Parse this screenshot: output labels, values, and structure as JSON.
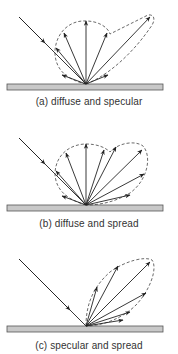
{
  "panels": [
    {
      "id": "a",
      "caption": "(a) diffuse and specular",
      "type": "diffuse-and-specular"
    },
    {
      "id": "b",
      "caption": "(b) diffuse and spread",
      "type": "diffuse-and-spread"
    },
    {
      "id": "c",
      "caption": "(c) specular and spread",
      "type": "specular-and-spread"
    }
  ],
  "colors": {
    "surface_fill": "#c8c8c8",
    "surface_stroke": "#555555",
    "ray": "#222222",
    "envelope": "#444444"
  }
}
